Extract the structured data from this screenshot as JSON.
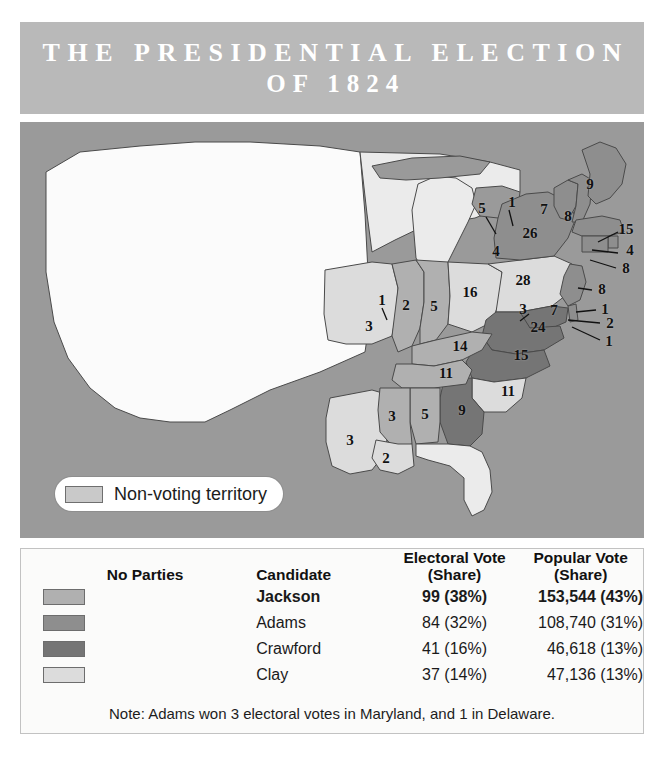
{
  "title": {
    "line1": "THE PRESIDENTIAL ELECTION",
    "line2": "OF 1824"
  },
  "map": {
    "nonvoting_legend_label": "Non-voting territory",
    "nonvoting_swatch_color": "#c9c9c9",
    "background_color": "#9a9a9a",
    "state_votes": [
      {
        "state": "Maine",
        "value": "9",
        "x": 570,
        "y": 62
      },
      {
        "state": "Vermont",
        "value": "7",
        "x": 524,
        "y": 87
      },
      {
        "state": "New Hampshire",
        "value": "8",
        "x": 548,
        "y": 94
      },
      {
        "state": "Massachusetts",
        "value": "15",
        "x": 604,
        "y": 107
      },
      {
        "state": "Rhode Island",
        "value": "4",
        "x": 608,
        "y": 128
      },
      {
        "state": "Connecticut",
        "value": "8",
        "x": 604,
        "y": 145
      },
      {
        "state": "New York",
        "value": "26",
        "x": 510,
        "y": 111
      },
      {
        "state": "Michigan-Territory-1",
        "value": "1",
        "x": 492,
        "y": 83
      },
      {
        "state": "Wisconsin-Territory-5",
        "value": "5",
        "x": 464,
        "y": 89
      },
      {
        "state": "Territory-4",
        "value": "4",
        "x": 478,
        "y": 129
      },
      {
        "state": "Pennsylvania",
        "value": "28",
        "x": 503,
        "y": 155
      },
      {
        "state": "New Jersey",
        "value": "8",
        "x": 582,
        "y": 167
      },
      {
        "state": "Delaware",
        "value": "1",
        "x": 585,
        "y": 187
      },
      {
        "state": "Maryland",
        "value": "2",
        "x": 590,
        "y": 200
      },
      {
        "state": "Maryland-b",
        "value": "1",
        "x": 589,
        "y": 218
      },
      {
        "state": "Ohio",
        "value": "16",
        "x": 448,
        "y": 170
      },
      {
        "state": "Indiana",
        "value": "5",
        "x": 412,
        "y": 184
      },
      {
        "state": "Illinois",
        "value": "2",
        "x": 385,
        "y": 183
      },
      {
        "state": "Missouri",
        "value": "3",
        "x": 351,
        "y": 204
      },
      {
        "state": "Missouri-b",
        "value": "1",
        "x": 362,
        "y": 180
      },
      {
        "state": "Virginia",
        "value": "24",
        "x": 518,
        "y": 204
      },
      {
        "state": "Virginia-b",
        "value": "3",
        "x": 505,
        "y": 187
      },
      {
        "state": "Virginia-c",
        "value": "7",
        "x": 533,
        "y": 188
      },
      {
        "state": "Kentucky",
        "value": "14",
        "x": 440,
        "y": 223
      },
      {
        "state": "Tennessee",
        "value": "11",
        "x": 427,
        "y": 250
      },
      {
        "state": "North Carolina",
        "value": "15",
        "x": 500,
        "y": 233
      },
      {
        "state": "South Carolina",
        "value": "11",
        "x": 488,
        "y": 268
      },
      {
        "state": "Georgia",
        "value": "9",
        "x": 442,
        "y": 287
      },
      {
        "state": "Alabama",
        "value": "5",
        "x": 405,
        "y": 291
      },
      {
        "state": "Mississippi",
        "value": "3",
        "x": 370,
        "y": 294
      },
      {
        "state": "Louisiana",
        "value": "2",
        "x": 366,
        "y": 334
      },
      {
        "state": "Arkansas-Territory",
        "value": "3",
        "x": 330,
        "y": 318
      }
    ]
  },
  "results": {
    "headers": {
      "party": "No Parties",
      "candidate": "Candidate",
      "electoral_line1": "Electoral Vote",
      "electoral_line2": "(Share)",
      "popular_line1": "Popular Vote",
      "popular_line2": "(Share)"
    },
    "rows": [
      {
        "swatch": "#b0b0b0",
        "candidate": "Jackson",
        "electoral": "99 (38%)",
        "popular": "153,544 (43%)",
        "leader": true
      },
      {
        "swatch": "#8e8e8e",
        "candidate": "Adams",
        "electoral": "84 (32%)",
        "popular": "108,740 (31%)",
        "leader": false
      },
      {
        "swatch": "#757575",
        "candidate": "Crawford",
        "electoral": "41 (16%)",
        "popular": "46,618 (13%)",
        "leader": false
      },
      {
        "swatch": "#dcdcdc",
        "candidate": "Clay",
        "electoral": "37 (14%)",
        "popular": "47,136 (13%)",
        "leader": false
      }
    ],
    "note": "Note: Adams won 3 electoral votes in Maryland, and 1 in Delaware."
  },
  "colors": {
    "title_band": "#b9b9b9",
    "map_background": "#9a9a9a",
    "jackson": "#b0b0b0",
    "adams": "#8e8e8e",
    "crawford": "#757575",
    "clay": "#dcdcdc",
    "nonvoting": "#e8e8e8",
    "panel": "#fbfbfa"
  }
}
